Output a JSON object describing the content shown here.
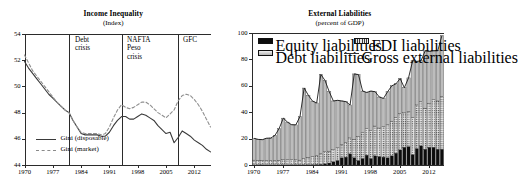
{
  "figure": {
    "panels": [
      {
        "id": "income-inequality",
        "title": "Income Inequality",
        "subtitle": "(Index)",
        "legend": [
          {
            "label": "Gini (disposable)",
            "style": "solid",
            "color": "#3a3a3a"
          },
          {
            "label": "Gini (market)",
            "style": "dashed",
            "color": "#8a8a8a"
          }
        ],
        "events": [
          {
            "label": "Debt\ncrisis",
            "year": 1981
          },
          {
            "label": "NAFTA\nPeso\ncrisis",
            "year": 1994
          },
          {
            "label": "GFC",
            "year": 2008
          }
        ]
      },
      {
        "id": "external-liabilities",
        "title": "External Liabilities",
        "subtitle": "(percent of GDP)",
        "legend": [
          {
            "label": "Equity liabilities",
            "swatch": "black"
          },
          {
            "label": "FDI liabilities",
            "swatch": "fdi"
          },
          {
            "label": "Debt liabilities",
            "swatch": "gray"
          },
          {
            "label": "Gross external liabilities",
            "swatch": "line"
          }
        ]
      }
    ]
  },
  "chart_data": [
    {
      "type": "line",
      "title": "Income Inequality",
      "subtitle": "(Index)",
      "xlabel": "",
      "ylabel": "",
      "ylim": [
        44,
        54
      ],
      "yticks": [
        44,
        46,
        48,
        50,
        52,
        54
      ],
      "xlim": [
        1970,
        2016
      ],
      "xticks": [
        1970,
        1977,
        1984,
        1991,
        1998,
        2005,
        2012
      ],
      "grid": false,
      "legend_position": "bottom-left",
      "annotations": [
        {
          "text": "Debt crisis",
          "year": 1981
        },
        {
          "text": "NAFTA Peso crisis",
          "year": 1994
        },
        {
          "text": "GFC",
          "year": 2008
        }
      ],
      "x": [
        1970,
        1971,
        1972,
        1973,
        1974,
        1975,
        1976,
        1977,
        1978,
        1979,
        1980,
        1981,
        1982,
        1983,
        1984,
        1985,
        1986,
        1987,
        1988,
        1989,
        1990,
        1991,
        1992,
        1993,
        1994,
        1995,
        1996,
        1997,
        1998,
        1999,
        2000,
        2001,
        2002,
        2003,
        2004,
        2005,
        2006,
        2007,
        2008,
        2009,
        2010,
        2011,
        2012,
        2013,
        2014,
        2015,
        2016
      ],
      "series": [
        {
          "name": "Gini (disposable)",
          "style": "solid",
          "values": [
            51.9,
            51.4,
            51.0,
            50.6,
            50.2,
            49.8,
            49.4,
            49.1,
            48.8,
            48.5,
            48.2,
            48.0,
            47.4,
            46.9,
            46.4,
            46.3,
            46.3,
            46.3,
            46.3,
            46.2,
            46.2,
            46.5,
            47.0,
            47.4,
            47.7,
            47.7,
            47.5,
            47.5,
            47.7,
            47.9,
            47.8,
            47.6,
            47.4,
            47.0,
            46.7,
            46.4,
            46.5,
            45.7,
            46.1,
            46.6,
            46.4,
            46.2,
            45.9,
            45.7,
            45.5,
            45.2,
            45.0
          ]
        },
        {
          "name": "Gini (market)",
          "style": "dashed",
          "values": [
            52.4,
            51.8,
            51.2,
            50.8,
            50.4,
            50.0,
            49.6,
            49.2,
            48.8,
            48.5,
            48.2,
            48.0,
            47.4,
            46.9,
            46.5,
            46.4,
            46.4,
            46.4,
            46.4,
            46.3,
            46.4,
            46.9,
            47.6,
            48.2,
            48.6,
            48.4,
            48.3,
            48.4,
            48.6,
            48.8,
            48.8,
            48.6,
            48.3,
            48.0,
            47.8,
            47.6,
            47.9,
            48.2,
            48.9,
            49.3,
            49.4,
            49.3,
            49.0,
            48.6,
            48.1,
            47.5,
            46.9
          ]
        }
      ]
    },
    {
      "type": "bar",
      "title": "External Liabilities",
      "subtitle": "(percent of GDP)",
      "xlabel": "",
      "ylabel": "",
      "ylim": [
        0,
        100
      ],
      "yticks": [
        0,
        20,
        40,
        60,
        80,
        100
      ],
      "xticks": [
        1970,
        1977,
        1984,
        1991,
        1998,
        2005,
        2012
      ],
      "grid": false,
      "stacked": true,
      "legend_position": "top",
      "categories": [
        1970,
        1971,
        1972,
        1973,
        1974,
        1975,
        1976,
        1977,
        1978,
        1979,
        1980,
        1981,
        1982,
        1983,
        1984,
        1985,
        1986,
        1987,
        1988,
        1989,
        1990,
        1991,
        1992,
        1993,
        1994,
        1995,
        1996,
        1997,
        1998,
        1999,
        2000,
        2001,
        2002,
        2003,
        2004,
        2005,
        2006,
        2007,
        2008,
        2009,
        2010,
        2011,
        2012,
        2013,
        2014,
        2015
      ],
      "series": [
        {
          "name": "Equity liabilities",
          "fill": "black",
          "values": [
            0.2,
            0.2,
            0.2,
            0.2,
            0.2,
            0.2,
            0.2,
            0.2,
            0.2,
            0.3,
            0.3,
            0.3,
            0.3,
            0.3,
            0.4,
            0.5,
            0.6,
            1.0,
            1.5,
            2.5,
            3.5,
            5.5,
            6.0,
            8.5,
            5.5,
            3.5,
            5.0,
            7.5,
            5.0,
            7.0,
            6.5,
            6.0,
            5.5,
            7.0,
            9.0,
            11.5,
            13.5,
            14.0,
            8.0,
            12.5,
            14.5,
            12.0,
            13.5,
            13.5,
            12.0,
            12.0
          ]
        },
        {
          "name": "FDI liabilities",
          "fill": "fdi",
          "values": [
            3.5,
            3.4,
            3.3,
            3.3,
            3.2,
            3.2,
            3.4,
            3.8,
            3.8,
            3.7,
            3.6,
            3.4,
            4.5,
            5.5,
            6.0,
            6.5,
            8.0,
            9.0,
            9.0,
            9.0,
            9.5,
            10.0,
            11.0,
            12.0,
            14.0,
            18.0,
            19.5,
            20.0,
            21.0,
            22.5,
            21.5,
            23.0,
            25.0,
            26.0,
            27.0,
            27.5,
            26.0,
            26.5,
            28.0,
            33.0,
            33.5,
            31.0,
            33.0,
            36.0,
            36.5,
            40.0
          ]
        },
        {
          "name": "Debt liabilities",
          "fill": "gray",
          "values": [
            16.5,
            15.8,
            15.7,
            16.8,
            17.0,
            19.0,
            24.0,
            31.5,
            28.5,
            26.5,
            26.5,
            33.0,
            53.5,
            47.0,
            42.0,
            40.0,
            60.0,
            54.0,
            45.0,
            37.0,
            36.0,
            33.0,
            31.0,
            25.0,
            49.5,
            47.0,
            31.5,
            27.5,
            30.0,
            26.0,
            23.5,
            21.5,
            25.0,
            27.0,
            25.5,
            26.5,
            19.0,
            25.5,
            43.0,
            33.0,
            31.0,
            43.5,
            39.5,
            37.0,
            38.0,
            46.0
          ]
        }
      ],
      "line_series": {
        "name": "Gross external liabilities",
        "values": [
          20.2,
          19.4,
          19.2,
          20.3,
          20.4,
          22.4,
          27.6,
          35.5,
          32.5,
          30.5,
          30.4,
          36.7,
          58.3,
          52.8,
          48.4,
          47.0,
          68.6,
          64.0,
          55.5,
          48.5,
          49.0,
          48.5,
          48.0,
          45.5,
          69.0,
          68.5,
          56.0,
          55.0,
          56.0,
          55.5,
          51.5,
          50.5,
          55.5,
          60.0,
          61.5,
          65.5,
          58.5,
          66.0,
          79.0,
          78.5,
          79.0,
          86.5,
          86.0,
          86.5,
          86.5,
          98.0
        ]
      }
    }
  ]
}
